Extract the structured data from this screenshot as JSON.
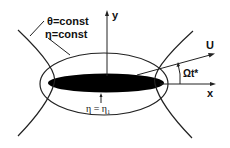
{
  "diagram": {
    "labels": {
      "theta_const": "θ=const",
      "eta_const": "η=const",
      "y_axis": "y",
      "x_axis": "x",
      "velocity": "U",
      "angle": "Ωt*",
      "body_surface": "η = η₁"
    },
    "colors": {
      "line": "#222222",
      "body": "#000000",
      "background": "#ffffff"
    }
  }
}
